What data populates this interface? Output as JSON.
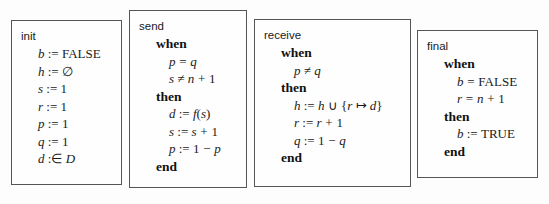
{
  "diagram": {
    "type": "event-b-machine-events",
    "background_color": "#fdfdfd",
    "box_border_color": "#555555",
    "boxes": [
      {
        "name": "init",
        "title": "init",
        "x": 11,
        "y": 20,
        "width": 111,
        "height": 165,
        "lines": [
          {
            "indent": 1,
            "kind": "math",
            "text": "b := FALSE"
          },
          {
            "indent": 1,
            "kind": "math",
            "text": "h := ∅"
          },
          {
            "indent": 1,
            "kind": "math",
            "text": "s := 1"
          },
          {
            "indent": 1,
            "kind": "math",
            "text": "r := 1"
          },
          {
            "indent": 1,
            "kind": "math",
            "text": "p := 1"
          },
          {
            "indent": 1,
            "kind": "math",
            "text": "q := 1"
          },
          {
            "indent": 1,
            "kind": "math",
            "text": "d :∈ D"
          }
        ]
      },
      {
        "name": "send",
        "title": "send",
        "x": 129,
        "y": 10,
        "width": 118,
        "height": 178,
        "lines": [
          {
            "indent": 1,
            "kind": "keyword",
            "text": "when"
          },
          {
            "indent": 2,
            "kind": "math",
            "text": "p = q"
          },
          {
            "indent": 2,
            "kind": "math",
            "text": "s ≠ n + 1"
          },
          {
            "indent": 1,
            "kind": "keyword",
            "text": "then"
          },
          {
            "indent": 2,
            "kind": "math",
            "text": "d := f(s)"
          },
          {
            "indent": 2,
            "kind": "math",
            "text": "s := s + 1"
          },
          {
            "indent": 2,
            "kind": "math",
            "text": "p := 1 − p"
          },
          {
            "indent": 1,
            "kind": "keyword",
            "text": "end"
          }
        ]
      },
      {
        "name": "receive",
        "title": "receive",
        "x": 254,
        "y": 19,
        "width": 157,
        "height": 168,
        "lines": [
          {
            "indent": 1,
            "kind": "keyword",
            "text": "when"
          },
          {
            "indent": 2,
            "kind": "math",
            "text": "p ≠ q"
          },
          {
            "indent": 1,
            "kind": "keyword",
            "text": "then"
          },
          {
            "indent": 2,
            "kind": "math",
            "text": "h := h ∪ {r ↦ d}"
          },
          {
            "indent": 2,
            "kind": "math",
            "text": "r := r + 1"
          },
          {
            "indent": 2,
            "kind": "math",
            "text": "q := 1 − q"
          },
          {
            "indent": 1,
            "kind": "keyword",
            "text": "end"
          }
        ]
      },
      {
        "name": "final",
        "title": "final",
        "x": 417,
        "y": 30,
        "width": 121,
        "height": 148,
        "lines": [
          {
            "indent": 1,
            "kind": "keyword",
            "text": "when"
          },
          {
            "indent": 2,
            "kind": "math",
            "text": "b = FALSE"
          },
          {
            "indent": 2,
            "kind": "math",
            "text": "r = n + 1"
          },
          {
            "indent": 1,
            "kind": "keyword",
            "text": "then"
          },
          {
            "indent": 2,
            "kind": "math",
            "text": "b := TRUE"
          },
          {
            "indent": 1,
            "kind": "keyword",
            "text": "end"
          }
        ]
      }
    ]
  }
}
